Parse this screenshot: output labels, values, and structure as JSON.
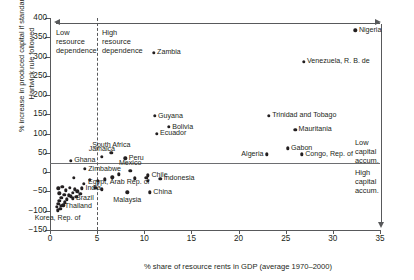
{
  "chart_data": {
    "type": "scatter",
    "title": "",
    "xlabel": "% share of resource rents in GDP (average 1970–2000)",
    "ylabel": "% increase in produced capital if standard\nHartwick rule followed",
    "xlim": [
      0,
      35
    ],
    "ylim": [
      -150,
      400
    ],
    "xticks": [
      0,
      5,
      10,
      15,
      20,
      25,
      30,
      35
    ],
    "yticks": [
      -150,
      -100,
      -50,
      0,
      50,
      100,
      150,
      200,
      250,
      300,
      350,
      400
    ],
    "grid": false,
    "legend": null,
    "reference_lines": [
      {
        "name": "resource-dependence-divider",
        "orientation": "vertical",
        "x": 5,
        "style": "dashed"
      },
      {
        "name": "zero-capital-line",
        "orientation": "horizontal",
        "y": 0,
        "style": "solid"
      }
    ],
    "annotations": [
      {
        "name": "low-resource-dependence",
        "text": "Low\nresource\ndependence"
      },
      {
        "name": "high-resource-dependence",
        "text": "High\nresource\ndependence"
      },
      {
        "name": "low-capital-accum",
        "text": "Low\ncapital\naccum."
      },
      {
        "name": "high-capital-accum",
        "text": "High\ncapital\naccum."
      }
    ],
    "points": [
      {
        "label": "Nigeria",
        "x": 32.4,
        "y": 368,
        "lp": "right"
      },
      {
        "label": "Venezuela, R. B. de",
        "x": 26.9,
        "y": 287,
        "lp": "right"
      },
      {
        "label": "Zambia",
        "x": 11.0,
        "y": 310,
        "lp": "right"
      },
      {
        "label": "Trinidad and Tobago",
        "x": 23.2,
        "y": 147,
        "lp": "right"
      },
      {
        "label": "Guyana",
        "x": 11.1,
        "y": 146,
        "lp": "right"
      },
      {
        "label": "Mauritania",
        "x": 26.0,
        "y": 110,
        "lp": "right"
      },
      {
        "label": "Bolivia",
        "x": 12.6,
        "y": 117,
        "lp": "right"
      },
      {
        "label": "Ecuador",
        "x": 11.3,
        "y": 100,
        "lp": "right"
      },
      {
        "label": "Gabon",
        "x": 25.2,
        "y": 62,
        "lp": "right"
      },
      {
        "label": "Congo, Rep. of",
        "x": 26.7,
        "y": 46,
        "lp": "right"
      },
      {
        "label": "Algeria",
        "x": 23.0,
        "y": 46,
        "lp": "left"
      },
      {
        "label": "South Africa",
        "x": 6.5,
        "y": 50,
        "lp": "above"
      },
      {
        "label": "Jamaica",
        "x": 5.5,
        "y": 40,
        "lp": "above"
      },
      {
        "label": "Peru",
        "x": 8.0,
        "y": 36,
        "lp": "right"
      },
      {
        "label": "Ghana",
        "x": 2.2,
        "y": 30,
        "lp": "right"
      },
      {
        "label": "Zimbabwe",
        "x": 3.7,
        "y": 8,
        "lp": "right"
      },
      {
        "label": "Mexico",
        "x": 8.5,
        "y": 4,
        "lp": "above"
      },
      {
        "label": "Chile",
        "x": 10.4,
        "y": -8,
        "lp": "right"
      },
      {
        "label": "Egypt, Arab Rep. of",
        "x": 7.3,
        "y": -6,
        "lp": "below"
      },
      {
        "label": "Indonesia",
        "x": 11.7,
        "y": -17,
        "lp": "right"
      },
      {
        "label": "India",
        "x": 3.4,
        "y": -42,
        "lp": "right"
      },
      {
        "label": "Brazil",
        "x": 2.4,
        "y": -68,
        "lp": "right"
      },
      {
        "label": "Malaysia",
        "x": 8.2,
        "y": -52,
        "lp": "below"
      },
      {
        "label": "China",
        "x": 10.6,
        "y": -52,
        "lp": "right"
      },
      {
        "label": "Thailand",
        "x": 1.2,
        "y": -88,
        "lp": "right"
      },
      {
        "label": "Korea, Rep. of",
        "x": 0.8,
        "y": -99,
        "lp": "below"
      },
      {
        "label": "",
        "x": 0.9,
        "y": -42
      },
      {
        "label": "",
        "x": 1.3,
        "y": -38
      },
      {
        "label": "",
        "x": 1.7,
        "y": -47
      },
      {
        "label": "",
        "x": 2.1,
        "y": -40
      },
      {
        "label": "",
        "x": 2.6,
        "y": -44
      },
      {
        "label": "",
        "x": 1.0,
        "y": -55
      },
      {
        "label": "",
        "x": 1.5,
        "y": -58
      },
      {
        "label": "",
        "x": 2.0,
        "y": -60
      },
      {
        "label": "",
        "x": 2.4,
        "y": -53
      },
      {
        "label": "",
        "x": 2.9,
        "y": -50
      },
      {
        "label": "",
        "x": 1.2,
        "y": -66
      },
      {
        "label": "",
        "x": 1.8,
        "y": -70
      },
      {
        "label": "",
        "x": 2.2,
        "y": -63
      },
      {
        "label": "",
        "x": 1.0,
        "y": -75
      },
      {
        "label": "",
        "x": 1.6,
        "y": -78
      },
      {
        "label": "",
        "x": 2.8,
        "y": -64
      },
      {
        "label": "",
        "x": 0.9,
        "y": -82
      },
      {
        "label": "",
        "x": 1.4,
        "y": -86
      },
      {
        "label": "",
        "x": 0.7,
        "y": -90
      },
      {
        "label": "",
        "x": 1.1,
        "y": -95
      },
      {
        "label": "",
        "x": 3.2,
        "y": -56
      },
      {
        "label": "",
        "x": 3.6,
        "y": -30
      },
      {
        "label": "",
        "x": 2.5,
        "y": -14
      },
      {
        "label": "",
        "x": 4.2,
        "y": -20
      },
      {
        "label": "",
        "x": 5.1,
        "y": -22
      },
      {
        "label": "",
        "x": 5.8,
        "y": -18
      },
      {
        "label": "",
        "x": 6.6,
        "y": -13
      },
      {
        "label": "",
        "x": 4.8,
        "y": -40
      },
      {
        "label": "",
        "x": 5.5,
        "y": -44
      },
      {
        "label": "",
        "x": 10.2,
        "y": -14
      },
      {
        "label": "",
        "x": 10.4,
        "y": -22
      },
      {
        "label": "",
        "x": 9.0,
        "y": -16
      }
    ]
  }
}
